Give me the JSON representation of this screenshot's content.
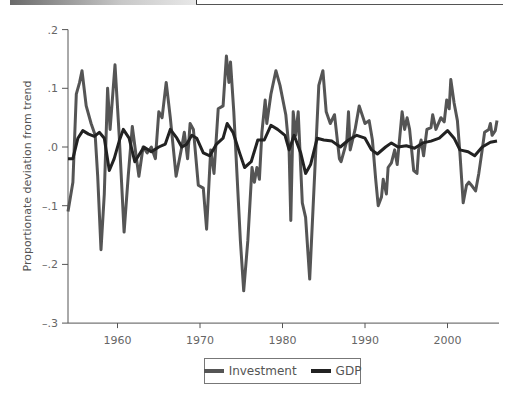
{
  "chart_data": {
    "type": "line",
    "title": "",
    "xlabel": "",
    "ylabel": "Proportionate deviation from trend",
    "xlim": [
      1954,
      2006
    ],
    "ylim": [
      -0.3,
      0.2
    ],
    "x_ticks": [
      1960,
      1970,
      1980,
      1990,
      2000
    ],
    "x_tick_labels": [
      "1960",
      "1970",
      "1980",
      "1990",
      "2000"
    ],
    "y_ticks": [
      0.2,
      0.1,
      0.0,
      -0.1,
      -0.2,
      -0.3
    ],
    "y_tick_labels": [
      ".2",
      ".1",
      ".0",
      "–.1",
      "–.2",
      "–.3"
    ],
    "grid": false,
    "legend_position": "bottom-center",
    "series": [
      {
        "name": "Investment",
        "color": "#555555",
        "points": [
          [
            1954.0,
            -0.11
          ],
          [
            1954.6,
            -0.06
          ],
          [
            1955.0,
            0.09
          ],
          [
            1955.4,
            0.11
          ],
          [
            1955.7,
            0.13
          ],
          [
            1956.2,
            0.07
          ],
          [
            1956.8,
            0.04
          ],
          [
            1957.3,
            0.02
          ],
          [
            1957.6,
            -0.05
          ],
          [
            1958.0,
            -0.175
          ],
          [
            1958.4,
            -0.08
          ],
          [
            1958.8,
            0.1
          ],
          [
            1959.1,
            0.03
          ],
          [
            1959.7,
            0.14
          ],
          [
            1960.2,
            0.02
          ],
          [
            1960.8,
            -0.145
          ],
          [
            1961.3,
            -0.05
          ],
          [
            1961.8,
            0.035
          ],
          [
            1962.3,
            -0.02
          ],
          [
            1962.6,
            -0.05
          ],
          [
            1963.1,
            0.0
          ],
          [
            1963.6,
            -0.01
          ],
          [
            1964.1,
            0.0
          ],
          [
            1964.6,
            -0.02
          ],
          [
            1965.0,
            0.06
          ],
          [
            1965.4,
            0.05
          ],
          [
            1965.9,
            0.11
          ],
          [
            1966.4,
            0.05
          ],
          [
            1967.1,
            -0.05
          ],
          [
            1967.8,
            0.0
          ],
          [
            1968.1,
            0.025
          ],
          [
            1968.5,
            -0.02
          ],
          [
            1968.8,
            0.04
          ],
          [
            1969.2,
            0.03
          ],
          [
            1969.8,
            -0.065
          ],
          [
            1970.4,
            -0.07
          ],
          [
            1970.8,
            -0.14
          ],
          [
            1971.3,
            -0.005
          ],
          [
            1971.7,
            -0.045
          ],
          [
            1972.2,
            0.065
          ],
          [
            1972.8,
            0.07
          ],
          [
            1973.2,
            0.155
          ],
          [
            1973.5,
            0.11
          ],
          [
            1973.7,
            0.145
          ],
          [
            1974.1,
            0.06
          ],
          [
            1974.9,
            -0.16
          ],
          [
            1975.3,
            -0.245
          ],
          [
            1975.8,
            -0.16
          ],
          [
            1976.3,
            -0.035
          ],
          [
            1976.6,
            -0.06
          ],
          [
            1976.9,
            -0.035
          ],
          [
            1977.2,
            -0.055
          ],
          [
            1977.5,
            0.025
          ],
          [
            1977.9,
            0.08
          ],
          [
            1978.1,
            0.04
          ],
          [
            1978.6,
            0.09
          ],
          [
            1979.2,
            0.13
          ],
          [
            1979.7,
            0.105
          ],
          [
            1980.4,
            0.055
          ],
          [
            1980.8,
            -0.005
          ],
          [
            1981.0,
            -0.125
          ],
          [
            1981.3,
            0.06
          ],
          [
            1981.6,
            0.02
          ],
          [
            1981.9,
            0.06
          ],
          [
            1982.4,
            -0.095
          ],
          [
            1982.8,
            -0.12
          ],
          [
            1983.3,
            -0.225
          ],
          [
            1983.9,
            -0.045
          ],
          [
            1984.4,
            0.105
          ],
          [
            1984.9,
            0.13
          ],
          [
            1985.3,
            0.06
          ],
          [
            1985.8,
            0.04
          ],
          [
            1986.3,
            0.055
          ],
          [
            1986.9,
            -0.02
          ],
          [
            1987.1,
            -0.025
          ],
          [
            1987.8,
            0.01
          ],
          [
            1988.0,
            0.06
          ],
          [
            1988.2,
            -0.005
          ],
          [
            1988.8,
            0.03
          ],
          [
            1989.3,
            0.07
          ],
          [
            1990.0,
            0.04
          ],
          [
            1990.5,
            0.045
          ],
          [
            1990.9,
            0.012
          ],
          [
            1991.3,
            -0.055
          ],
          [
            1991.6,
            -0.1
          ],
          [
            1992.0,
            -0.085
          ],
          [
            1992.2,
            -0.055
          ],
          [
            1992.6,
            -0.08
          ],
          [
            1992.8,
            -0.035
          ],
          [
            1993.2,
            -0.027
          ],
          [
            1993.6,
            -0.005
          ],
          [
            1993.9,
            -0.03
          ],
          [
            1994.5,
            0.06
          ],
          [
            1994.8,
            0.03
          ],
          [
            1995.1,
            0.05
          ],
          [
            1995.4,
            0.03
          ],
          [
            1995.9,
            -0.04
          ],
          [
            1996.3,
            -0.045
          ],
          [
            1996.5,
            -0.005
          ],
          [
            1996.8,
            0.012
          ],
          [
            1997.1,
            -0.015
          ],
          [
            1997.5,
            0.03
          ],
          [
            1998.0,
            0.033
          ],
          [
            1998.2,
            0.055
          ],
          [
            1998.6,
            0.03
          ],
          [
            1999.2,
            0.05
          ],
          [
            1999.6,
            0.043
          ],
          [
            1999.9,
            0.08
          ],
          [
            2000.2,
            0.065
          ],
          [
            2000.4,
            0.115
          ],
          [
            2000.8,
            0.075
          ],
          [
            2001.2,
            0.045
          ],
          [
            2001.5,
            -0.01
          ],
          [
            2001.9,
            -0.095
          ],
          [
            2002.3,
            -0.065
          ],
          [
            2002.6,
            -0.06
          ],
          [
            2003.0,
            -0.067
          ],
          [
            2003.4,
            -0.075
          ],
          [
            2003.8,
            -0.045
          ],
          [
            2004.2,
            -0.005
          ],
          [
            2004.5,
            0.025
          ],
          [
            2005.0,
            0.03
          ],
          [
            2005.2,
            0.04
          ],
          [
            2005.4,
            0.02
          ],
          [
            2005.8,
            0.028
          ],
          [
            2006.0,
            0.045
          ]
        ]
      },
      {
        "name": "GDP",
        "color": "#222222",
        "points": [
          [
            1954.0,
            -0.02
          ],
          [
            1954.6,
            -0.02
          ],
          [
            1955.2,
            0.015
          ],
          [
            1955.8,
            0.028
          ],
          [
            1956.5,
            0.022
          ],
          [
            1957.2,
            0.018
          ],
          [
            1957.8,
            0.025
          ],
          [
            1958.4,
            0.015
          ],
          [
            1959.0,
            -0.04
          ],
          [
            1959.6,
            -0.02
          ],
          [
            1960.2,
            0.01
          ],
          [
            1960.7,
            0.03
          ],
          [
            1961.4,
            0.015
          ],
          [
            1962.1,
            -0.025
          ],
          [
            1963.2,
            0.0
          ],
          [
            1964.1,
            -0.008
          ],
          [
            1965.0,
            0.0
          ],
          [
            1965.8,
            0.005
          ],
          [
            1966.4,
            0.03
          ],
          [
            1967.2,
            0.015
          ],
          [
            1967.8,
            0.0
          ],
          [
            1968.4,
            0.005
          ],
          [
            1969.0,
            0.02
          ],
          [
            1969.6,
            0.015
          ],
          [
            1970.4,
            -0.01
          ],
          [
            1971.2,
            -0.015
          ],
          [
            1972.0,
            0.005
          ],
          [
            1972.8,
            0.015
          ],
          [
            1973.3,
            0.04
          ],
          [
            1974.0,
            0.025
          ],
          [
            1974.8,
            -0.01
          ],
          [
            1975.4,
            -0.035
          ],
          [
            1976.2,
            -0.025
          ],
          [
            1977.0,
            0.012
          ],
          [
            1977.8,
            0.012
          ],
          [
            1978.6,
            0.037
          ],
          [
            1979.4,
            0.03
          ],
          [
            1980.3,
            0.02
          ],
          [
            1980.8,
            -0.005
          ],
          [
            1981.4,
            0.02
          ],
          [
            1982.2,
            -0.01
          ],
          [
            1982.8,
            -0.045
          ],
          [
            1983.4,
            -0.03
          ],
          [
            1984.2,
            0.015
          ],
          [
            1985.0,
            0.012
          ],
          [
            1986.0,
            0.01
          ],
          [
            1987.0,
            0.0
          ],
          [
            1988.0,
            0.012
          ],
          [
            1989.0,
            0.02
          ],
          [
            1990.0,
            0.015
          ],
          [
            1990.8,
            -0.005
          ],
          [
            1991.5,
            -0.012
          ],
          [
            1992.5,
            0.0
          ],
          [
            1993.2,
            0.007
          ],
          [
            1994.0,
            0.0
          ],
          [
            1995.0,
            0.002
          ],
          [
            1996.0,
            -0.002
          ],
          [
            1997.0,
            0.007
          ],
          [
            1998.0,
            0.01
          ],
          [
            1999.0,
            0.015
          ],
          [
            2000.0,
            0.028
          ],
          [
            2000.8,
            0.015
          ],
          [
            2001.5,
            -0.005
          ],
          [
            2002.5,
            -0.008
          ],
          [
            2003.3,
            -0.015
          ],
          [
            2004.2,
            0.0
          ],
          [
            2005.2,
            0.008
          ],
          [
            2006.0,
            0.01
          ]
        ]
      }
    ]
  },
  "legend": {
    "items": [
      {
        "label": "Investment",
        "color": "#555555"
      },
      {
        "label": "GDP",
        "color": "#222222"
      }
    ]
  }
}
